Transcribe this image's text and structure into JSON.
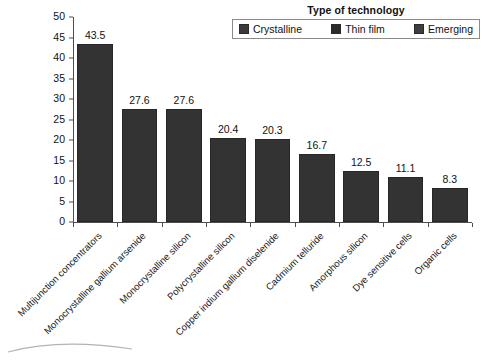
{
  "legend": {
    "title": "Type of technology",
    "entries": [
      {
        "label": "Crystalline",
        "color": "#3a3a3a"
      },
      {
        "label": "Thin film",
        "color": "#2b2b2b"
      },
      {
        "label": "Emerging",
        "color": "#3f3f3f"
      }
    ]
  },
  "chart_data": {
    "type": "bar",
    "title": "",
    "xlabel": "",
    "ylabel": "",
    "ylim": [
      0,
      50
    ],
    "ytick_step": 5,
    "yticks": [
      50,
      45,
      40,
      35,
      30,
      25,
      20,
      15,
      10,
      5,
      0
    ],
    "grid": false,
    "legend_position": "top-right",
    "bar_color": "#333333",
    "categories": [
      "Multijunction concentrators",
      "Monocrystalline gallium arsenide",
      "Monocrystalline silicon",
      "Polycrystalline silicon",
      "Copper indium gallium diselenide",
      "Cadmium telluride",
      "Amorphous silicon",
      "Dye sensitive cells",
      "Organic cells"
    ],
    "values": [
      43.5,
      27.6,
      27.6,
      20.4,
      20.3,
      16.7,
      12.5,
      11.1,
      8.3
    ],
    "value_labels": [
      "43.5",
      "27.6",
      "27.6",
      "20.4",
      "20.3",
      "16.7",
      "12.5",
      "11.1",
      "8.3"
    ]
  }
}
